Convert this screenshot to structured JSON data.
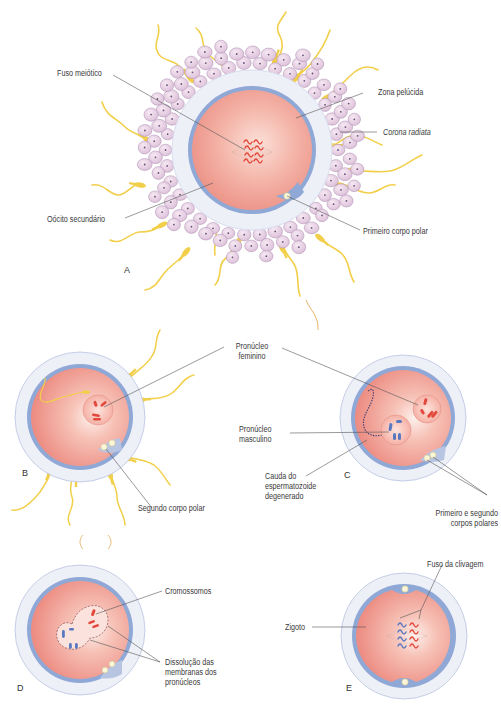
{
  "figure": {
    "colors": {
      "cytoplasm": "#ef8f86",
      "cytoplasm_light": "#fbe3dc",
      "membrane": "#8fa8d6",
      "zona": "#eef0f8",
      "zona_edge": "#b9c3e2",
      "corona_cell": "#e6cde3",
      "corona_edge": "#a988b0",
      "sperm": "#f2cf4a",
      "chromosome_female": "#e2493c",
      "chromosome_male": "#5a78c0",
      "leader_line": "#555555",
      "label_text": "#3a3a3a"
    },
    "panels": {
      "A": {
        "letter": "A",
        "labels": {
          "fuso_meiotico": "Fuso meiótico",
          "zona_pelucida": "Zona pelúcida",
          "corona_radiata": "Corona radiata",
          "oocito_secundario": "Oócito secundário",
          "primeiro_corpo_polar": "Primeiro corpo polar"
        }
      },
      "B": {
        "letter": "B",
        "labels": {
          "segundo_corpo_polar": "Segundo corpo polar"
        }
      },
      "shared": {
        "pronucleo_feminino_l1": "Pronúcleo",
        "pronucleo_feminino_l2": "feminino"
      },
      "C": {
        "letter": "C",
        "labels": {
          "pronucleo_masculino_l1": "Pronúcleo",
          "pronucleo_masculino_l2": "masculino",
          "cauda_l1": "Cauda do",
          "cauda_l2": "espermatozoide",
          "cauda_l3": "degenerado",
          "corpos_polares_l1": "Primeiro e segundo",
          "corpos_polares_l2": "corpos polares"
        }
      },
      "D": {
        "letter": "D",
        "labels": {
          "cromossomos": "Cromossomos",
          "dissolucao_l1": "Dissolução das",
          "dissolucao_l2": "membranas dos",
          "dissolucao_l3": "pronúcleos"
        }
      },
      "E": {
        "letter": "E",
        "labels": {
          "fuso_clivagem": "Fuso da clivagem",
          "zigoto": "Zigoto"
        }
      }
    }
  }
}
